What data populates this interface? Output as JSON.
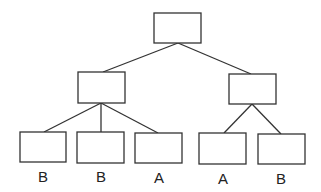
{
  "diagram": {
    "type": "tree",
    "nodes": [
      {
        "id": "root",
        "x": 154,
        "y": 13,
        "w": 47,
        "h": 30,
        "label": ""
      },
      {
        "id": "left",
        "x": 78,
        "y": 72,
        "w": 47,
        "h": 31,
        "label": ""
      },
      {
        "id": "right",
        "x": 229,
        "y": 74,
        "w": 47,
        "h": 30,
        "label": ""
      },
      {
        "id": "leaf1",
        "x": 20,
        "y": 132,
        "w": 46,
        "h": 30,
        "label": "B"
      },
      {
        "id": "leaf2",
        "x": 77,
        "y": 132,
        "w": 47,
        "h": 31,
        "label": "B"
      },
      {
        "id": "leaf3",
        "x": 135,
        "y": 133,
        "w": 47,
        "h": 30,
        "label": "A"
      },
      {
        "id": "leaf4",
        "x": 199,
        "y": 133,
        "w": 47,
        "h": 31,
        "label": "A"
      },
      {
        "id": "leaf5",
        "x": 258,
        "y": 134,
        "w": 47,
        "h": 30,
        "label": "B"
      }
    ],
    "edges": [
      {
        "from": "root",
        "to": "left"
      },
      {
        "from": "root",
        "to": "right"
      },
      {
        "from": "left",
        "to": "leaf1"
      },
      {
        "from": "left",
        "to": "leaf2"
      },
      {
        "from": "left",
        "to": "leaf3"
      },
      {
        "from": "right",
        "to": "leaf4"
      },
      {
        "from": "right",
        "to": "leaf5"
      }
    ],
    "leaf_labels": [
      "B",
      "B",
      "A",
      "A",
      "B"
    ]
  }
}
